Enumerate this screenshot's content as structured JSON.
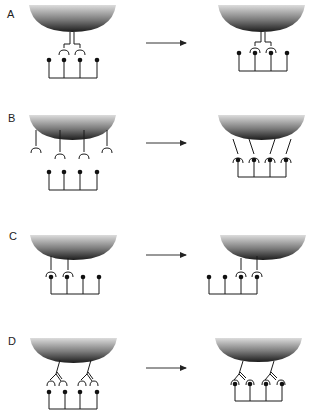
{
  "colors": {
    "stroke": "#1a1a1a",
    "arrow": "#333333",
    "bowl_dark": "#1e1e1e",
    "bowl_light": "#d8d8d8"
  },
  "panels": [
    {
      "label": "A",
      "top": 0,
      "description": "Adaptor-linked receptors: paired sockets on a stalk bind to ligand bundle",
      "left_state": "paired receptors unbound",
      "right_state": "middle ligands bound"
    },
    {
      "label": "B",
      "top": 104,
      "description": "Four separate receptors spread across surface",
      "left_state": "unbound, spread out",
      "right_state": "all four ligands bound, receptors converge"
    },
    {
      "label": "C",
      "top": 214,
      "description": "Two receptors on left side",
      "left_state": "receptors over left two ligands",
      "right_state": "receptors shift to right two ligands"
    },
    {
      "label": "D",
      "top": 314,
      "description": "Two branched (bivalent) receptors",
      "left_state": "unbound",
      "right_state": "each branched receptor binds two ligands"
    }
  ]
}
